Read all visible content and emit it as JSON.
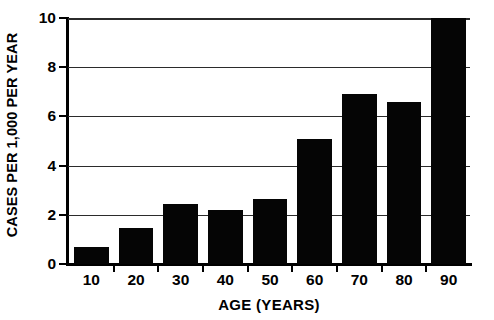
{
  "chart_data": {
    "type": "bar",
    "title": "",
    "subtitle": "",
    "xlabel": "AGE  (YEARS)",
    "ylabel": "CASES PER 1,000 PER YEAR",
    "categories": [
      "10",
      "20",
      "30",
      "40",
      "50",
      "60",
      "70",
      "80",
      "90"
    ],
    "values": [
      0.7,
      1.45,
      2.45,
      2.2,
      2.65,
      5.1,
      6.9,
      6.6,
      10.0
    ],
    "ylim": [
      0,
      10
    ],
    "yticks": [
      "0",
      "2",
      "4",
      "6",
      "8",
      "10"
    ],
    "ytick_values": [
      0,
      2,
      4,
      6,
      8,
      10
    ],
    "xlim_categories": 9,
    "grid": "horizontal",
    "legend": "none",
    "bar_color": "#050505",
    "axis_color": "#000000",
    "background_color": "#ffffff",
    "annotations": []
  },
  "figure": {
    "y_axis_title": "CASES PER 1,000 PER YEAR",
    "x_axis_title": "AGE  (YEARS)"
  }
}
